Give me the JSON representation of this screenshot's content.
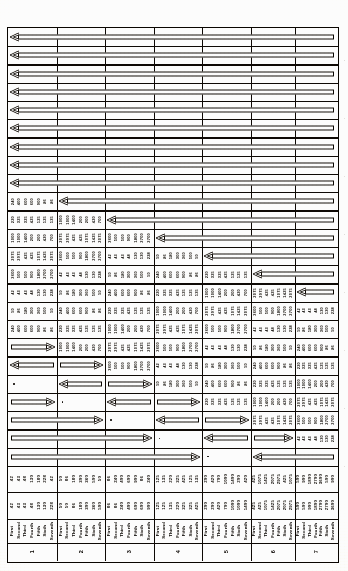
{
  "document": {
    "kind": "scanned-rotated-table",
    "orientation": "text-rotated-90-ccw",
    "title": "",
    "columns": 7,
    "rows": 28
  },
  "row_labels": [
    "First",
    "Second",
    "Third",
    "Fourth",
    "Fifth",
    "Sixth",
    "Seventh"
  ],
  "column_index_labels": [
    "1",
    "2",
    "3",
    "4",
    "5",
    "6",
    "7"
  ],
  "chart_data": {
    "type": "table",
    "title": "",
    "note": "Staircase (lower-triangular) matrix: arrow cells on/above the diagonal, paired numeric series below.",
    "columns": [
      "1",
      "2",
      "3",
      "4",
      "5",
      "6",
      "7"
    ],
    "row_labels": [
      "First",
      "Second",
      "Third",
      "Fourth",
      "Fifth",
      "Sixth",
      "Seventh"
    ]
  },
  "numeric_bands": {
    "band_a": [
      [
        "42",
        "43",
        "48",
        "130",
        "180",
        "228"
      ],
      [
        "50",
        "86",
        "180",
        "300",
        "360",
        "500"
      ],
      [
        "86",
        "240",
        "400",
        "600",
        "900"
      ],
      [
        "125",
        "135",
        "220",
        "325",
        "425"
      ],
      [
        "200",
        "420",
        "700",
        "1000",
        "1400"
      ],
      [
        "425",
        "1075",
        "1425",
        "2075",
        "2975"
      ],
      [
        "500",
        "900",
        "1800",
        "2700",
        "3600"
      ]
    ],
    "band_b": [
      [
        "42",
        "43",
        "43",
        "48",
        "130",
        "130",
        "228"
      ],
      [
        "50",
        "50",
        "86",
        "180",
        "300",
        "360",
        "500"
      ],
      [
        "86",
        "86",
        "240",
        "400",
        "600",
        "600",
        "900"
      ],
      [
        "125",
        "125",
        "135",
        "220",
        "325",
        "325",
        "425"
      ],
      [
        "200",
        "200",
        "420",
        "700",
        "1000",
        "1000",
        "1400"
      ],
      [
        "425",
        "425",
        "1075",
        "1425",
        "2075",
        "2075",
        "2975"
      ],
      [
        "500",
        "500",
        "900",
        "1800",
        "2700",
        "2700",
        "3600"
      ]
    ]
  },
  "matrix_cells": {
    "comment": "Per row: list of 7 entries. 'arrow-left' / 'arrow-right' / 'numbers' / 'dot' / 'empty'.",
    "rows": [
      [
        "arrow-left-wide",
        "span",
        "span",
        "span",
        "span",
        "span",
        "span"
      ],
      [
        "arrow-left-wide",
        "span",
        "span",
        "span",
        "span",
        "span",
        "span"
      ],
      [
        "arrow-left-wide",
        "span",
        "span",
        "span",
        "span",
        "span",
        "span"
      ],
      [
        "arrow-left-wide",
        "span",
        "span",
        "span",
        "span",
        "span",
        "span"
      ],
      [
        "arrow-left-wide",
        "span",
        "span",
        "span",
        "span",
        "span",
        "span"
      ],
      [
        "arrow-left-wide",
        "span",
        "span",
        "span",
        "span",
        "span",
        "span"
      ],
      [
        "arrow-left-wide",
        "span",
        "span",
        "span",
        "span",
        "span",
        "span"
      ],
      [
        "arrow-left-wide",
        "span",
        "span",
        "span",
        "span",
        "span",
        "span"
      ],
      [
        "arrow-left-wide",
        "span",
        "span",
        "span",
        "span",
        "span",
        "span"
      ],
      [
        "numbers",
        "arrow-left",
        "span",
        "span",
        "span",
        "span",
        "span"
      ],
      [
        "numbers",
        "numbers",
        "arrow-left",
        "span",
        "span",
        "span",
        "span"
      ],
      [
        "numbers",
        "numbers",
        "numbers",
        "arrow-left",
        "span",
        "span",
        "span"
      ],
      [
        "numbers",
        "numbers",
        "numbers",
        "numbers",
        "arrow-left",
        "span",
        "span"
      ],
      [
        "numbers",
        "numbers",
        "numbers",
        "numbers",
        "numbers",
        "arrow-left",
        "span"
      ],
      [
        "numbers",
        "numbers",
        "numbers",
        "numbers",
        "numbers",
        "numbers",
        "arrow-left"
      ],
      [
        "numbers",
        "numbers",
        "numbers",
        "numbers",
        "numbers",
        "numbers",
        "numbers"
      ],
      [
        "arrow-right",
        "numbers",
        "numbers",
        "numbers",
        "numbers",
        "numbers",
        "numbers"
      ],
      [
        "arrow-left",
        "arrow-right",
        "numbers",
        "numbers",
        "numbers",
        "numbers",
        "numbers"
      ],
      [
        "dot",
        "arrow-left",
        "arrow-right",
        "numbers",
        "numbers",
        "numbers",
        "numbers"
      ],
      [
        "arrow-right",
        "dot",
        "arrow-left",
        "arrow-right",
        "numbers",
        "numbers",
        "numbers"
      ],
      [
        "arrow-right-wide",
        "dot",
        "arrow-left",
        "arrow-right",
        "numbers",
        "numbers",
        "numbers"
      ],
      [
        "arrow-right-wide3",
        "dot",
        "arrow-left",
        "arrow-right",
        "numbers",
        "numbers",
        "numbers"
      ],
      [
        "arrow-right-wide5",
        "dot",
        "arrow-left-wide2",
        "span",
        "numbers",
        "numbers",
        "numbers"
      ],
      [
        "arrow-right-wide5",
        "dot",
        "arrow-left-wide2",
        "span",
        "span",
        "numbers",
        "numbers"
      ]
    ]
  },
  "edge_marks": {
    "right": [
      "·",
      "·",
      "·",
      "·",
      "·",
      "·",
      "·",
      "·"
    ]
  }
}
